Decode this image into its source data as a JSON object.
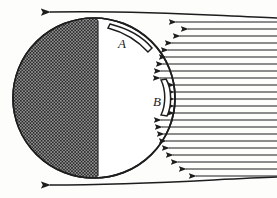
{
  "figure": {
    "type": "technical-line-diagram",
    "background_color": "#fdfdfc",
    "ink_color": "#1d1d1d",
    "width": 277,
    "height": 198
  },
  "body_shape": {
    "name": "circle",
    "center_x": 94,
    "center_y": 98,
    "radius_x": 81,
    "radius_y": 80,
    "stroke_color": "#1d1d1d",
    "stroke_width": 1.6,
    "fill_color": "#ffffff"
  },
  "hatched_region": {
    "description": "cross-hatched left half of the circle",
    "boundary_x": 98,
    "hatch_color": "#2a2a2a",
    "hatch_spacing": 3.2,
    "hatch_angle_deg": 45
  },
  "slots": [
    {
      "label": "A",
      "label_x": 122,
      "label_y": 43,
      "description": "curved slot on upper right of circle boundary",
      "start_x": 112,
      "start_y": 25,
      "end_x": 153,
      "end_y": 47,
      "stroke_color": "#1d1d1d"
    },
    {
      "label": "B",
      "label_x": 158,
      "label_y": 101,
      "description": "narrow vertical curved slot on right of circle boundary",
      "start_x": 169,
      "start_y": 80,
      "end_x": 169,
      "end_y": 114,
      "stroke_color": "#1d1d1d"
    }
  ],
  "streamlines": {
    "direction": "right-to-left",
    "arrowhead": "left-pointing",
    "color": "#1d1d1d",
    "right_edge_x": 277,
    "count": 26,
    "top_bounding_line": {
      "y": 12,
      "start_x": 50,
      "arrow_x": 62,
      "description": "upper bounding streamline with leftward arrow"
    },
    "bottom_bounding_line": {
      "y": 185,
      "start_x": 50,
      "arrow_x": 62,
      "description": "lower bounding streamline with leftward arrow"
    },
    "rows": [
      {
        "y": 22,
        "x_start": 176,
        "arrow_x": 182
      },
      {
        "y": 29,
        "x_start": 188,
        "arrow_x": 194
      },
      {
        "y": 36,
        "x_start": 180,
        "arrow_x": 186
      },
      {
        "y": 43,
        "x_start": 172,
        "arrow_x": 178
      },
      {
        "y": 50,
        "x_start": 168,
        "arrow_x": 174
      },
      {
        "y": 57,
        "x_start": 166,
        "arrow_x": 172
      },
      {
        "y": 64,
        "x_start": 163,
        "arrow_x": 169
      },
      {
        "y": 71,
        "x_start": 161,
        "arrow_x": 167
      },
      {
        "y": 78,
        "x_start": 160,
        "arrow_x": 166
      },
      {
        "y": 85,
        "x_start": 174,
        "arrow_x": 180
      },
      {
        "y": 92,
        "x_start": 174,
        "arrow_x": 180
      },
      {
        "y": 99,
        "x_start": 174,
        "arrow_x": 180
      },
      {
        "y": 106,
        "x_start": 174,
        "arrow_x": 180
      },
      {
        "y": 113,
        "x_start": 174,
        "arrow_x": 180
      },
      {
        "y": 120,
        "x_start": 161,
        "arrow_x": 167
      },
      {
        "y": 127,
        "x_start": 162,
        "arrow_x": 168
      },
      {
        "y": 134,
        "x_start": 164,
        "arrow_x": 170
      },
      {
        "y": 141,
        "x_start": 166,
        "arrow_x": 172
      },
      {
        "y": 148,
        "x_start": 169,
        "arrow_x": 175
      },
      {
        "y": 155,
        "x_start": 173,
        "arrow_x": 179
      },
      {
        "y": 162,
        "x_start": 178,
        "arrow_x": 184
      },
      {
        "y": 169,
        "x_start": 186,
        "arrow_x": 192
      },
      {
        "y": 176,
        "x_start": 196,
        "arrow_x": 202
      }
    ]
  }
}
